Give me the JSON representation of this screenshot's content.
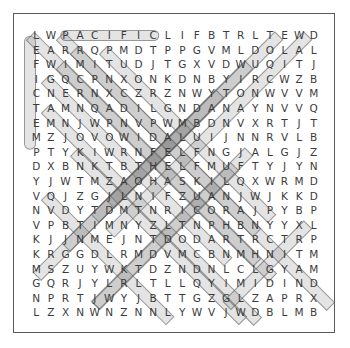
{
  "puzzle": {
    "type": "word-search",
    "rows": 20,
    "cols": 20,
    "border_color": "#5a5a5a",
    "letter_color": "#3b3b3b",
    "highlight_color": "rgba(120,120,120,0.20)",
    "highlight_border_color": "rgba(90,90,90,0.55)",
    "background_color": "#ffffff",
    "grid": [
      [
        "L",
        "W",
        "P",
        "A",
        "C",
        "I",
        "F",
        "I",
        "C",
        "L",
        "I",
        "F",
        "B",
        "T",
        "R",
        "L",
        "T",
        "E",
        "W",
        "D"
      ],
      [
        "E",
        "A",
        "R",
        "R",
        "Q",
        "P",
        "M",
        "D",
        "T",
        "P",
        "P",
        "G",
        "V",
        "M",
        "L",
        "D",
        "O",
        "L",
        "A",
        "L"
      ],
      [
        "F",
        "W",
        "I",
        "M",
        "I",
        "T",
        "U",
        "D",
        "J",
        "T",
        "G",
        "X",
        "V",
        "D",
        "W",
        "U",
        "Q",
        "I",
        "T",
        "J"
      ],
      [
        "I",
        "G",
        "Q",
        "C",
        "P",
        "N",
        "X",
        "O",
        "N",
        "K",
        "D",
        "N",
        "B",
        "Y",
        "I",
        "R",
        "C",
        "W",
        "Z",
        "B"
      ],
      [
        "C",
        "N",
        "E",
        "R",
        "N",
        "X",
        "C",
        "Z",
        "R",
        "Z",
        "N",
        "W",
        "Y",
        "T",
        "O",
        "N",
        "W",
        "V",
        "V",
        "M"
      ],
      [
        "T",
        "A",
        "M",
        "N",
        "Q",
        "A",
        "D",
        "I",
        "L",
        "G",
        "N",
        "D",
        "A",
        "N",
        "A",
        "Y",
        "N",
        "V",
        "V",
        "Q"
      ],
      [
        "E",
        "M",
        "N",
        "J",
        "W",
        "P",
        "N",
        "V",
        "P",
        "W",
        "M",
        "B",
        "D",
        "N",
        "V",
        "X",
        "R",
        "T",
        "J",
        "T"
      ],
      [
        "M",
        "Z",
        "J",
        "O",
        "V",
        "O",
        "W",
        "I",
        "D",
        "A",
        "L",
        "U",
        "I",
        "J",
        "N",
        "N",
        "R",
        "V",
        "L",
        "B"
      ],
      [
        "P",
        "T",
        "Y",
        "K",
        "I",
        "W",
        "R",
        "N",
        "F",
        "E",
        "L",
        "F",
        "N",
        "G",
        "J",
        "A",
        "L",
        "G",
        "J",
        "Z"
      ],
      [
        "D",
        "X",
        "B",
        "N",
        "K",
        "T",
        "B",
        "T",
        "H",
        "E",
        "L",
        "F",
        "M",
        "U",
        "F",
        "T",
        "Y",
        "J",
        "Y",
        "N"
      ],
      [
        "Y",
        "J",
        "W",
        "T",
        "M",
        "Z",
        "A",
        "O",
        "H",
        "A",
        "S",
        "K",
        "I",
        "L",
        "Q",
        "X",
        "W",
        "R",
        "M",
        "D"
      ],
      [
        "V",
        "Q",
        "J",
        "Z",
        "G",
        "J",
        "L",
        "N",
        "I",
        "F",
        "Z",
        "U",
        "A",
        "N",
        "J",
        "W",
        "J",
        "K",
        "K",
        "D"
      ],
      [
        "N",
        "V",
        "D",
        "Y",
        "T",
        "D",
        "M",
        "T",
        "N",
        "R",
        "I",
        "C",
        "O",
        "R",
        "A",
        "J",
        "P",
        "Y",
        "B",
        "P"
      ],
      [
        "V",
        "P",
        "B",
        "T",
        "I",
        "M",
        "N",
        "Y",
        "Z",
        "L",
        "T",
        "N",
        "P",
        "H",
        "B",
        "N",
        "Y",
        "Y",
        "X",
        "L"
      ],
      [
        "K",
        "J",
        "J",
        "N",
        "M",
        "E",
        "J",
        "N",
        "T",
        "D",
        "O",
        "D",
        "A",
        "R",
        "T",
        "R",
        "C",
        "T",
        "R",
        "P"
      ],
      [
        "K",
        "R",
        "G",
        "G",
        "D",
        "L",
        "R",
        "M",
        "D",
        "V",
        "M",
        "C",
        "B",
        "N",
        "M",
        "H",
        "N",
        "I",
        "T",
        "M"
      ],
      [
        "M",
        "S",
        "Z",
        "U",
        "Y",
        "W",
        "K",
        "T",
        "D",
        "Z",
        "N",
        "D",
        "N",
        "L",
        "C",
        "L",
        "G",
        "Y",
        "A",
        "M"
      ],
      [
        "G",
        "Q",
        "R",
        "J",
        "Y",
        "L",
        "R",
        "L",
        "T",
        "L",
        "L",
        "Q",
        "Y",
        "I",
        "M",
        "I",
        "D",
        "I",
        "N",
        "D"
      ],
      [
        "N",
        "P",
        "R",
        "T",
        "J",
        "W",
        "Y",
        "J",
        "B",
        "T",
        "T",
        "G",
        "Z",
        "G",
        "L",
        "Z",
        "A",
        "P",
        "R",
        "X"
      ],
      [
        "L",
        "Z",
        "X",
        "N",
        "W",
        "N",
        "Z",
        "N",
        "N",
        "L",
        "Y",
        "W",
        "V",
        "J",
        "W",
        "D",
        "B",
        "L",
        "M",
        "B"
      ]
    ],
    "found_words": [
      {
        "name": "pacific-horizontal",
        "letters": "PACIFIC",
        "start_row": 1,
        "start_col": 3,
        "end_row": 1,
        "end_col": 9,
        "direction": "horizontal"
      },
      {
        "name": "left-column-vertical",
        "letters": "LEFICTEM",
        "start_row": 1,
        "start_col": 1,
        "end_row": 8,
        "end_col": 1,
        "direction": "vertical"
      },
      {
        "name": "diagonal-down-right-a",
        "start_row": 1,
        "start_col": 1,
        "end_row": 16,
        "end_col": 16,
        "direction": "diagonal-down-right"
      },
      {
        "name": "diagonal-down-right-b",
        "start_row": 1,
        "start_col": 3,
        "end_row": 19,
        "end_col": 21,
        "direction": "diagonal-down-right"
      },
      {
        "name": "diagonal-down-right-c",
        "start_row": 2,
        "start_col": 4,
        "end_row": 14,
        "end_col": 16,
        "direction": "diagonal-down-right"
      },
      {
        "name": "diagonal-down-right-d",
        "start_row": 2,
        "start_col": 6,
        "end_row": 13,
        "end_col": 17,
        "direction": "diagonal-down-right"
      },
      {
        "name": "diagonal-down-right-e",
        "start_row": 3,
        "start_col": 3,
        "end_row": 17,
        "end_col": 17,
        "direction": "diagonal-down-right"
      },
      {
        "name": "diagonal-down-right-f",
        "start_row": 4,
        "start_col": 2,
        "end_row": 16,
        "end_col": 14,
        "direction": "diagonal-down-right"
      },
      {
        "name": "diagonal-down-right-g",
        "start_row": 6,
        "start_col": 2,
        "end_row": 20,
        "end_col": 16,
        "direction": "diagonal-down-right"
      },
      {
        "name": "diagonal-down-right-h",
        "start_row": 9,
        "start_col": 4,
        "end_row": 20,
        "end_col": 15,
        "direction": "diagonal-down-right"
      },
      {
        "name": "diagonal-down-right-i",
        "start_row": 12,
        "start_col": 2,
        "end_row": 20,
        "end_col": 10,
        "direction": "diagonal-down-right"
      },
      {
        "name": "diagonal-down-left-a",
        "start_row": 1,
        "start_col": 18,
        "end_row": 12,
        "end_col": 7,
        "direction": "diagonal-down-left"
      },
      {
        "name": "diagonal-down-left-b",
        "start_row": 1,
        "start_col": 20,
        "end_row": 14,
        "end_col": 7,
        "direction": "diagonal-down-left"
      },
      {
        "name": "diagonal-down-left-c",
        "start_row": 3,
        "start_col": 16,
        "end_row": 13,
        "end_col": 6,
        "direction": "diagonal-down-left"
      },
      {
        "name": "diagonal-down-left-d",
        "start_row": 5,
        "start_col": 14,
        "end_row": 15,
        "end_col": 4,
        "direction": "diagonal-down-left"
      },
      {
        "name": "diagonal-down-left-e",
        "start_row": 7,
        "start_col": 12,
        "end_row": 17,
        "end_col": 2,
        "direction": "diagonal-down-left"
      },
      {
        "name": "diagonal-down-left-f",
        "start_row": 9,
        "start_col": 16,
        "end_row": 19,
        "end_col": 6,
        "direction": "diagonal-down-left"
      },
      {
        "name": "diagonal-down-left-g",
        "start_row": 10,
        "start_col": 15,
        "end_row": 19,
        "end_col": 6,
        "direction": "diagonal-down-left"
      },
      {
        "name": "diagonal-down-left-h",
        "start_row": 14,
        "start_col": 20,
        "end_row": 19,
        "end_col": 15,
        "direction": "diagonal-down-left"
      }
    ]
  }
}
